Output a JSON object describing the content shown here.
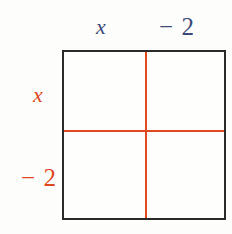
{
  "figure": {
    "type": "area-model-grid",
    "background_color": "#fdfdfb",
    "box": {
      "border_color": "#2b2b2b",
      "fill_color": "#fefefc",
      "divider_color": "#e0491f",
      "rows": 2,
      "columns": 2
    },
    "column_headers": {
      "color": "#3d4a79",
      "items": [
        {
          "text": "x",
          "style": "italic"
        },
        {
          "text": "− 2",
          "style": "normal"
        }
      ]
    },
    "row_headers": {
      "color": "#de481f",
      "items": [
        {
          "text": "x",
          "style": "italic"
        },
        {
          "text": "− 2",
          "style": "normal"
        }
      ]
    },
    "cells": [
      {
        "row": 0,
        "column": 0,
        "text": ""
      },
      {
        "row": 0,
        "column": 1,
        "text": ""
      },
      {
        "row": 1,
        "column": 0,
        "text": ""
      },
      {
        "row": 1,
        "column": 1,
        "text": ""
      }
    ]
  }
}
